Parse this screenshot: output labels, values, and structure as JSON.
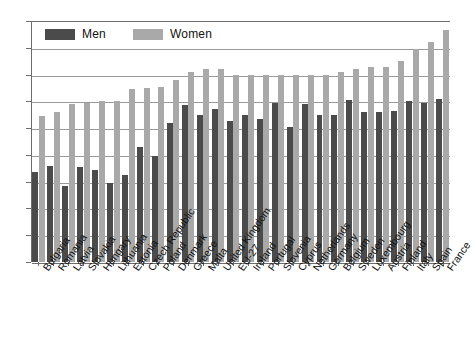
{
  "chart_data": {
    "type": "bar",
    "title": "",
    "xlabel": "",
    "ylabel": "",
    "ylim": [
      10,
      28
    ],
    "yticks": [
      10,
      12,
      14,
      16,
      18,
      20,
      22,
      24,
      26,
      28
    ],
    "grid": true,
    "legend_position": "top-left",
    "colors": {
      "men": "#4b4b4b",
      "women": "#a9a9a9",
      "grid": "#9a9a9a",
      "axis": "#6d6d6d",
      "background": "#ffffff"
    },
    "categories": [
      "Bulgaria",
      "Romania",
      "Latvia",
      "Slovakia",
      "Hungary",
      "Lithuania",
      "Estonia",
      "Czech Republic",
      "Poland",
      "Denmark",
      "Greece",
      "Malta",
      "United Kingdom",
      "EU-27",
      "Ireland",
      "Portugal",
      "Slovenia",
      "Cyprus",
      "Netherlands",
      "Germany",
      "Belgium",
      "Sweden",
      "Luxembourg",
      "Austria",
      "Finland",
      "Italy",
      "Spain",
      "France"
    ],
    "series": [
      {
        "name": "Men",
        "color": "#4b4b4b",
        "values": [
          16.7,
          17.2,
          15.7,
          17.1,
          16.9,
          15.9,
          16.5,
          18.6,
          17.9,
          20.4,
          21.7,
          21.0,
          21.4,
          20.5,
          21.0,
          20.7,
          21.9,
          20.1,
          21.8,
          21.0,
          21.0,
          22.1,
          21.2,
          21.2,
          21.3,
          22.0,
          21.9,
          22.2
        ]
      },
      {
        "name": "Women",
        "color": "#a9a9a9",
        "values": [
          20.9,
          21.2,
          21.8,
          21.9,
          22.0,
          22.0,
          22.9,
          23.0,
          23.1,
          23.6,
          24.2,
          24.4,
          24.4,
          24.0,
          24.0,
          24.0,
          24.0,
          24.0,
          24.0,
          24.0,
          24.2,
          24.4,
          24.6,
          24.6,
          25.0,
          25.9,
          26.4,
          27.3
        ]
      }
    ],
    "legend": [
      {
        "label": "Men",
        "color": "#4b4b4b",
        "swatch": "legend-swatch-men"
      },
      {
        "label": "Women",
        "color": "#a9a9a9",
        "swatch": "legend-swatch-women"
      }
    ],
    "ytick_labels": [
      "10",
      "12",
      "14",
      "16",
      "18",
      "20",
      "22",
      "24",
      "26",
      "28"
    ]
  }
}
